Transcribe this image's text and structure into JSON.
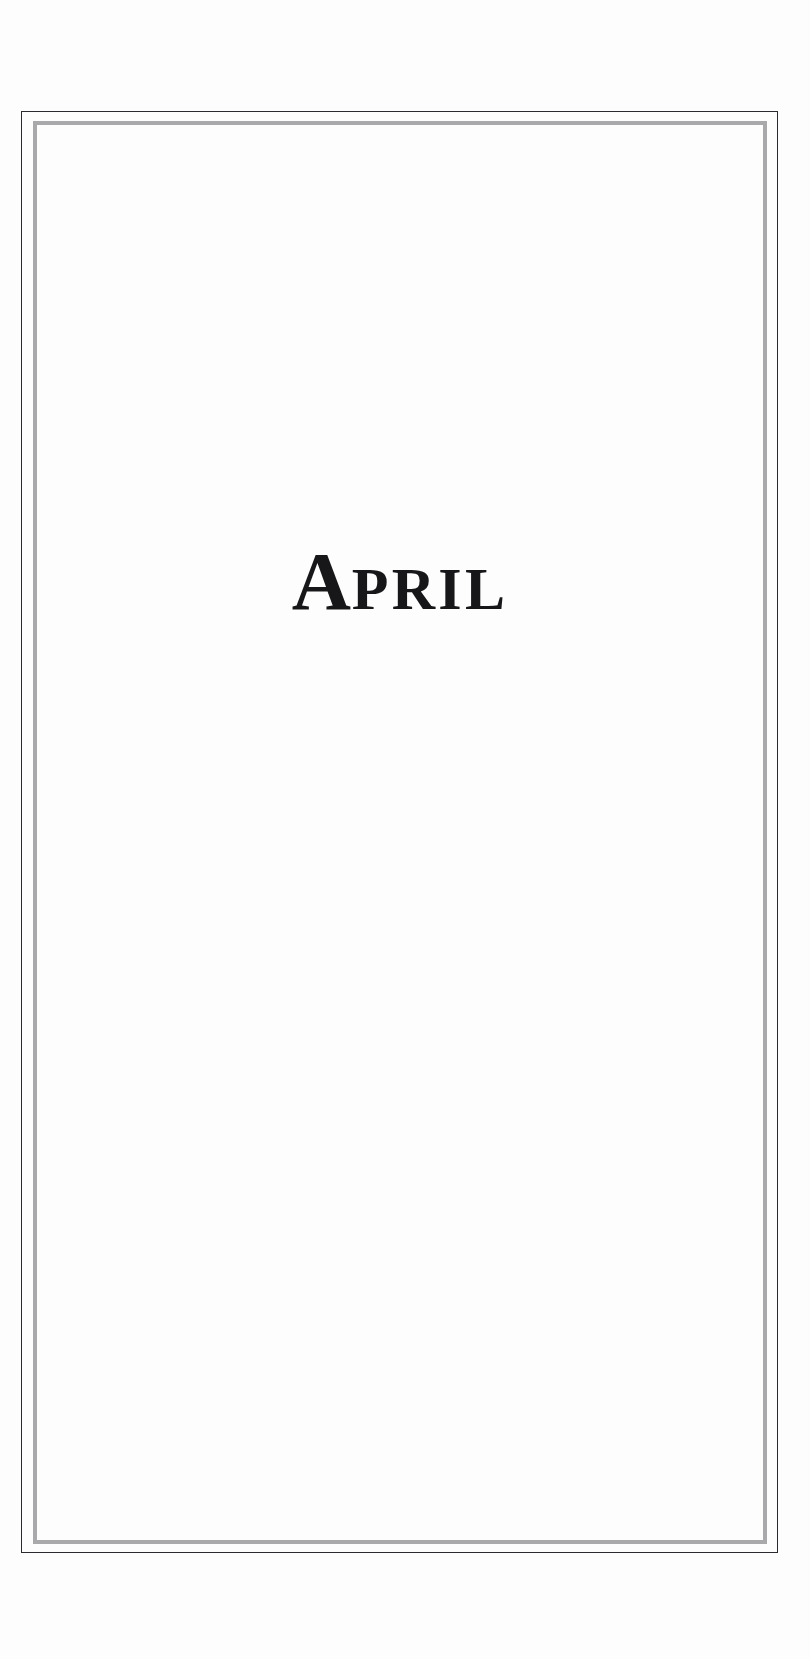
{
  "page": {
    "type": "book-section-divider",
    "background_color": "#fdfdfd",
    "width": 810,
    "height": 1659
  },
  "frame": {
    "outer_rule_color": "#2b2b2f",
    "inner_rule_color": "#a9a9ac",
    "outer_rule_width_px": 1,
    "inner_rule_width_px": 4
  },
  "title": {
    "full_text": "APRIL",
    "initial_cap": "A",
    "remaining_small_caps": "PRIL",
    "style": "small-caps-serif",
    "color": "#17171a"
  }
}
